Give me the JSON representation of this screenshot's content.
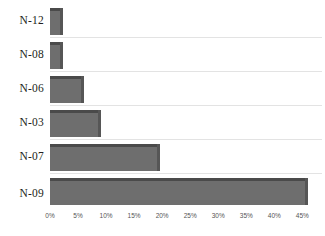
{
  "chart_data": {
    "type": "bar",
    "orientation": "horizontal",
    "title": "",
    "subtitle": "",
    "xlabel": "",
    "ylabel": "",
    "categories": [
      "N-12",
      "N-08",
      "N-06",
      "N-03",
      "N-07",
      "N-09"
    ],
    "values": [
      1.8,
      1.8,
      5.5,
      8.5,
      19.0,
      45.5
    ],
    "value_suffix": "%",
    "series": [
      {
        "name": "",
        "values": [
          1.8,
          1.8,
          5.5,
          8.5,
          19.0,
          45.5
        ]
      }
    ],
    "xlim": [
      0,
      48.5
    ],
    "xticks": [
      0,
      5,
      10,
      15,
      20,
      25,
      30,
      35,
      40,
      45
    ],
    "xtick_labels": [
      "0%",
      "5%",
      "10%",
      "15%",
      "20%",
      "25%",
      "30%",
      "35%",
      "40%",
      "45%"
    ],
    "grid": "horizontal-category-separators",
    "legend": "none",
    "bar_color": "#6e6e6e",
    "bar_top_shade": "#4a4a4a",
    "bar_side_shade": "#565656",
    "gridline_color": "#e3e3e3",
    "label_color": "#231f20",
    "tick_color": "#555555",
    "background": "#ffffff",
    "annotations": []
  }
}
